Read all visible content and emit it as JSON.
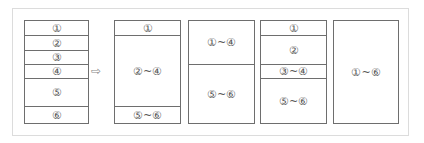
{
  "diagram": {
    "arrow_icon": "hollow-right-arrow",
    "columns": [
      {
        "cells": [
          {
            "label": "①",
            "h": 14
          },
          {
            "label": "②",
            "h": 15
          },
          {
            "label": "③",
            "h": 14
          },
          {
            "label": "④",
            "h": 14
          },
          {
            "label": "⑤",
            "h": 28
          },
          {
            "label": "⑥",
            "h": 17
          }
        ]
      },
      {
        "cells": [
          {
            "label": "①",
            "h": 14
          },
          {
            "label": "②~④",
            "h": 71
          },
          {
            "label": "⑤~⑥",
            "h": 17
          }
        ]
      },
      {
        "cells": [
          {
            "label": "①~④",
            "h": 43
          },
          {
            "label": "⑤~⑥",
            "h": 59
          }
        ]
      },
      {
        "cells": [
          {
            "label": "①",
            "h": 14
          },
          {
            "label": "②",
            "h": 29
          },
          {
            "label": "③~④",
            "h": 14
          },
          {
            "label": "⑤~⑥",
            "h": 45
          }
        ]
      },
      {
        "cells": [
          {
            "label": "①~⑥",
            "h": 102
          }
        ]
      }
    ],
    "arrow": "⇨"
  }
}
